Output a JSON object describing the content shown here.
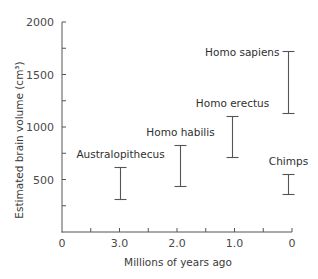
{
  "chart_data": {
    "type": "errorbar",
    "title": "",
    "xlabel": "Millions of years ago",
    "ylabel": "Estimated brain volume (cm³)",
    "x_axis": {
      "reversed": true,
      "ticks": [
        {
          "pos": 0.0,
          "label": "0"
        },
        {
          "pos": 0.5,
          "label": ""
        },
        {
          "pos": 1.0,
          "label": "1.0"
        },
        {
          "pos": 1.5,
          "label": ""
        },
        {
          "pos": 2.0,
          "label": "2.0"
        },
        {
          "pos": 2.5,
          "label": ""
        },
        {
          "pos": 3.0,
          "label": "3.0"
        },
        {
          "pos": 3.5,
          "label": ""
        },
        {
          "pos": 4.0,
          "label": "0"
        }
      ],
      "range": [
        4.0,
        0.0
      ]
    },
    "y_axis": {
      "ticks": [
        {
          "value": 0,
          "label": ""
        },
        {
          "value": 250,
          "label": ""
        },
        {
          "value": 500,
          "label": "500"
        },
        {
          "value": 750,
          "label": ""
        },
        {
          "value": 1000,
          "label": "1000"
        },
        {
          "value": 1250,
          "label": ""
        },
        {
          "value": 1500,
          "label": "1500"
        },
        {
          "value": 1750,
          "label": ""
        },
        {
          "value": 2000,
          "label": "2000"
        }
      ],
      "ylim": [
        0,
        2000
      ]
    },
    "grid": false,
    "legend": "none",
    "series": [
      {
        "name": "Australopithecus",
        "x": 3.0,
        "low": 310,
        "high": 620,
        "label_dx": 0,
        "label_above": 10
      },
      {
        "name": "Homo habilis",
        "x": 1.95,
        "low": 440,
        "high": 830,
        "label_dx": 0,
        "label_above": 10
      },
      {
        "name": "Homo erectus",
        "x": 1.05,
        "low": 710,
        "high": 1100,
        "label_dx": 0,
        "label_above": 10
      },
      {
        "name": "Homo sapiens",
        "x": 0.07,
        "low": 1130,
        "high": 1720,
        "label_side": "left"
      },
      {
        "name": "Chimps",
        "x": 0.07,
        "low": 360,
        "high": 550,
        "label_dx": 0,
        "label_above": 10
      }
    ]
  }
}
